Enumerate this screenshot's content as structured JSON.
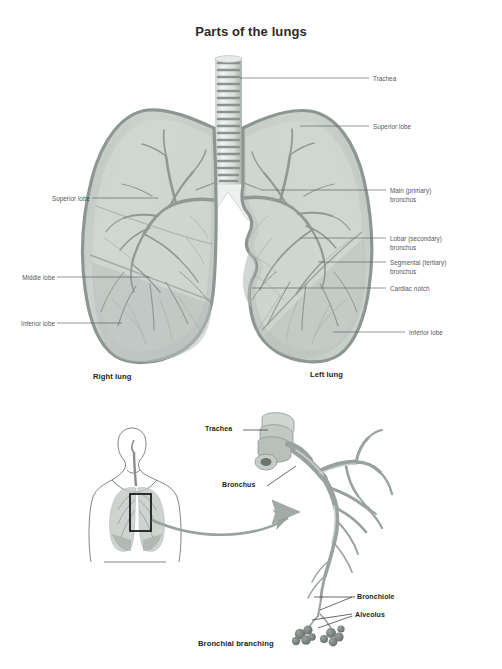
{
  "figure": {
    "title": "Parts of the lungs",
    "bottom_caption": "Bronchial branching"
  },
  "top_diagram": {
    "left_labels": [
      {
        "id": "superior-lobe-right",
        "text": "Superior lobe"
      },
      {
        "id": "middle-lobe",
        "text": "Middle lobe"
      },
      {
        "id": "inferior-lobe-right",
        "text": "Inferior lobe"
      }
    ],
    "right_labels": [
      {
        "id": "trachea",
        "text": "Trachea"
      },
      {
        "id": "superior-lobe-left",
        "text": "Superior lobe"
      },
      {
        "id": "main-bronchus-line1",
        "text": "Main (primary)"
      },
      {
        "id": "main-bronchus-line2",
        "text": "bronchus"
      },
      {
        "id": "lobar-bronchus-line1",
        "text": "Lobar (secondary)"
      },
      {
        "id": "lobar-bronchus-line2",
        "text": "bronchus"
      },
      {
        "id": "segmental-bronchus-line1",
        "text": "Segmental (tertiary)"
      },
      {
        "id": "segmental-bronchus-line2",
        "text": "bronchus"
      },
      {
        "id": "cardiac-notch",
        "text": "Cardiac notch"
      },
      {
        "id": "inferior-lobe-left",
        "text": "Inferior lobe"
      }
    ],
    "captions": [
      {
        "id": "right-lung",
        "text": "Right lung"
      },
      {
        "id": "left-lung",
        "text": "Left lung"
      }
    ]
  },
  "bottom_diagram": {
    "labels": [
      {
        "id": "trachea",
        "text": "Trachea"
      },
      {
        "id": "bronchus",
        "text": "Bronchus"
      },
      {
        "id": "bronchiole",
        "text": "Bronchiole"
      },
      {
        "id": "alveolus",
        "text": "Alveolus"
      }
    ]
  },
  "colors": {
    "background": "#ffffff",
    "title_text": "#2b2b2b",
    "label_text": "#55565a",
    "caption_text": "#232323",
    "leader_line": "#5d5d5d",
    "lung_outline": "#8f9a93",
    "lung_fill_light": "#cfd6d2",
    "lung_fill_mid": "#bcc4c0",
    "lung_fill_dark": "#a7b0ab",
    "bronchial_tree": "#8d9691",
    "trachea_ring": "#7d8783",
    "arrow": "#9aa29e",
    "body_outline": "#6e6e6e",
    "highlight_box": "#111111",
    "alveolus": "#6f7873"
  }
}
